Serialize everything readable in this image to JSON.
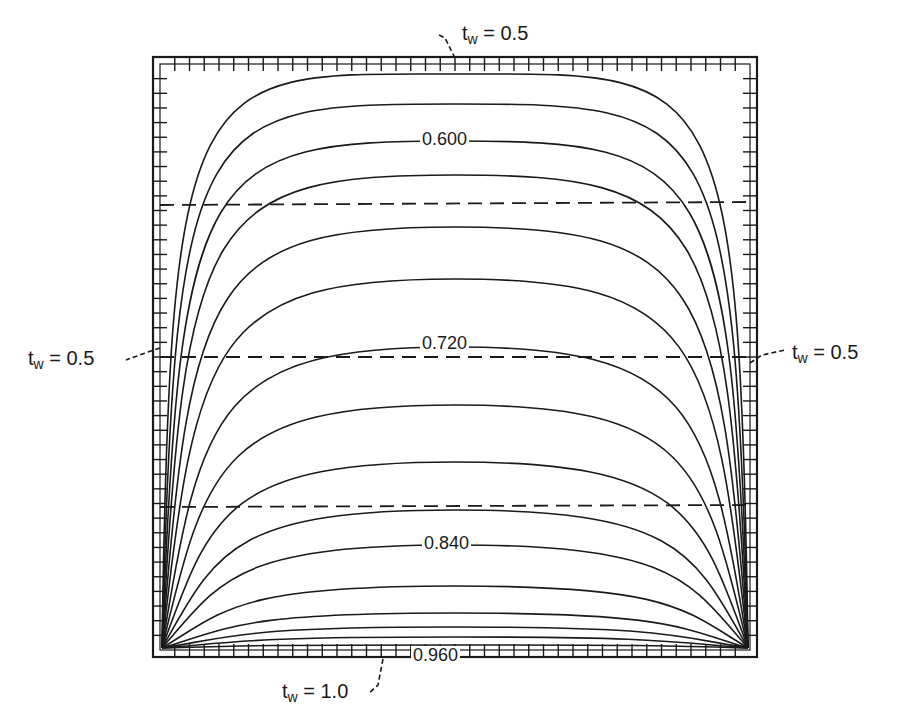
{
  "figure": {
    "type": "contour plot of temperature in a square domain",
    "boundary_labels": {
      "top": {
        "var": "t",
        "sub": "w",
        "eq": " = ",
        "value": "0.5"
      },
      "left": {
        "var": "t",
        "sub": "w",
        "eq": " = ",
        "value": "0.5"
      },
      "right": {
        "var": "t",
        "sub": "w",
        "eq": " = ",
        "value": "0.5"
      },
      "bottom": {
        "var": "t",
        "sub": "w",
        "eq": " = ",
        "value": "1.0"
      }
    },
    "contour_labels": [
      "0.600",
      "0.720",
      "0.840",
      "0.960"
    ],
    "contour_count": 18,
    "dashed_lines_count": 3,
    "colors": {
      "line": "#1a1a1a",
      "background": "#ffffff"
    }
  }
}
